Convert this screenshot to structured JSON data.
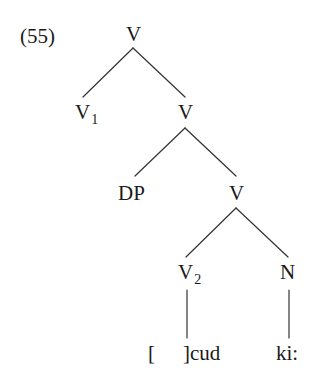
{
  "example_number": "(55)",
  "tree": {
    "root": {
      "label": "V",
      "subscript": ""
    },
    "level1": {
      "left": {
        "label": "V",
        "subscript": "1"
      },
      "right": {
        "label": "V",
        "subscript": ""
      }
    },
    "level2": {
      "left": {
        "label": "DP",
        "subscript": ""
      },
      "right": {
        "label": "V",
        "subscript": ""
      }
    },
    "level3": {
      "left": {
        "label": "V",
        "subscript": "2"
      },
      "right": {
        "label": "N",
        "subscript": ""
      }
    },
    "leaves": {
      "open_bracket": "[",
      "verb_root": "]cud",
      "noun": "ki:"
    }
  },
  "edges": [
    {
      "from": "root",
      "to": "V1"
    },
    {
      "from": "root",
      "to": "V"
    },
    {
      "from": "V",
      "to": "DP"
    },
    {
      "from": "V",
      "to": "V'"
    },
    {
      "from": "V'",
      "to": "V2"
    },
    {
      "from": "V'",
      "to": "N"
    },
    {
      "from": "V2",
      "to": "]cud"
    },
    {
      "from": "N",
      "to": "ki:"
    }
  ]
}
